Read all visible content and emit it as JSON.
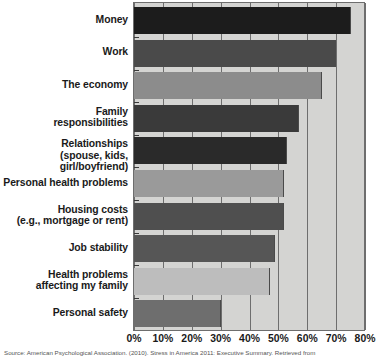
{
  "chart_data": {
    "type": "bar",
    "orientation": "horizontal",
    "title": "",
    "xlabel": "",
    "ylabel": "",
    "xlim": [
      0,
      80
    ],
    "grid": true,
    "legend": null,
    "tick_labels": [
      "0%",
      "10%",
      "20%",
      "30%",
      "40%",
      "50%",
      "60%",
      "70%",
      "80%"
    ],
    "tick_values": [
      0,
      10,
      20,
      30,
      40,
      50,
      60,
      70,
      80
    ],
    "categories": [
      "Money",
      "Work",
      "The economy",
      "Family responsibilities",
      "Relationships (spouse, kids, girl/boyfriend)",
      "Personal health problems",
      "Housing costs (e.g., mortgage or rent)",
      "Job stability",
      "Health problems affecting my family",
      "Personal safety"
    ],
    "values": [
      75,
      70,
      65,
      57,
      53,
      52,
      52,
      49,
      47,
      30
    ],
    "bar_colors": [
      "#1c1c1c",
      "#4a4a4a",
      "#8c8c8c",
      "#3a3a3a",
      "#2a2a2a",
      "#9a9a9a",
      "#4f4f4f",
      "#565656",
      "#bdbdbd",
      "#6e6e6e"
    ],
    "plot_background": "#d4d4d2"
  },
  "labels": [
    {
      "line1": "Money",
      "line2": ""
    },
    {
      "line1": "Work",
      "line2": ""
    },
    {
      "line1": "The economy",
      "line2": ""
    },
    {
      "line1": "Family",
      "line2": "responsibilities"
    },
    {
      "line1": "Relationships",
      "line2": "(spouse, kids, girl/boyfriend)"
    },
    {
      "line1": "Personal health problems",
      "line2": ""
    },
    {
      "line1": "Housing costs",
      "line2": "(e.g., mortgage or rent)"
    },
    {
      "line1": "Job stability",
      "line2": ""
    },
    {
      "line1": "Health problems",
      "line2": "affecting my family"
    },
    {
      "line1": "Personal safety",
      "line2": ""
    }
  ],
  "source": {
    "text": "Source: American Psychological Association. (2010). Stress in America 2011: Executive Summary. Retrieved from"
  }
}
